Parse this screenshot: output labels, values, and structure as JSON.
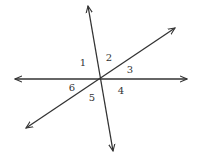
{
  "diagram": {
    "type": "intersecting-lines",
    "stroke_color": "#333333",
    "background": "#ffffff",
    "intersection": {
      "x": 100,
      "y": 79
    },
    "lines": [
      {
        "id": "horizontal-line",
        "from": {
          "x": 15,
          "y": 79
        },
        "to": {
          "x": 187,
          "y": 79
        },
        "arrows": "both"
      },
      {
        "id": "steep-line",
        "from": {
          "x": 88,
          "y": 6
        },
        "to": {
          "x": 113,
          "y": 151
        },
        "arrows": "both"
      },
      {
        "id": "diagonal-line",
        "from": {
          "x": 26,
          "y": 128
        },
        "to": {
          "x": 175,
          "y": 28
        },
        "arrows": "both"
      }
    ],
    "angle_labels": [
      {
        "text": "1",
        "x": 83,
        "y": 63
      },
      {
        "text": "2",
        "x": 109,
        "y": 58
      },
      {
        "text": "3",
        "x": 130,
        "y": 70
      },
      {
        "text": "4",
        "x": 121,
        "y": 91
      },
      {
        "text": "5",
        "x": 92,
        "y": 98
      },
      {
        "text": "6",
        "x": 72,
        "y": 88
      }
    ]
  }
}
